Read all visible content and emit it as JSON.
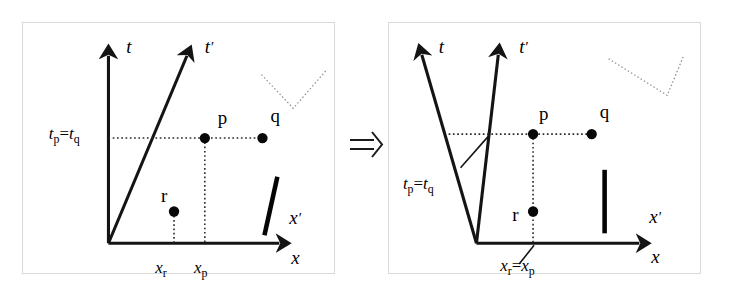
{
  "figure": {
    "transform_symbol": "⇒",
    "transform_name": "implies-arrow"
  },
  "panels": [
    {
      "id": "left",
      "name": "unprimed-frame-diagram",
      "caption": "Events p, q simultaneous in unprimed frame; t' axis tilted",
      "axes": [
        {
          "name": "t-axis",
          "label": "t",
          "prime": false,
          "orientation": "vertical",
          "label_x": 104,
          "label_y": 30
        },
        {
          "name": "t-prime-axis",
          "label": "t",
          "prime": true,
          "orientation": "tilted-right",
          "label_x": 183,
          "label_y": 30
        },
        {
          "name": "x-prime-axis",
          "label": "x",
          "prime": true,
          "orientation": "horizontal",
          "label_x": 268,
          "label_y": 203
        },
        {
          "name": "x-axis",
          "label": "x",
          "prime": false,
          "orientation": "horizontal",
          "label_x": 270,
          "label_y": 243
        }
      ],
      "tick_labels": [
        {
          "name": "t-p-equals-t-q-label",
          "base1": "t",
          "sub1": "p",
          "eq": "=",
          "base2": "t",
          "sub2": "q",
          "x": 26,
          "y": 117
        },
        {
          "name": "x-r-label",
          "base1": "x",
          "sub1": "r",
          "x": 133,
          "y": 252
        },
        {
          "name": "x-p-label",
          "base1": "x",
          "sub1": "p",
          "x": 172,
          "y": 252
        }
      ],
      "events": [
        {
          "name": "event-p",
          "label": "p",
          "cx": 183,
          "cy": 116,
          "label_x": 196,
          "label_y": 102
        },
        {
          "name": "event-q",
          "label": "q",
          "cx": 241,
          "cy": 116,
          "label_x": 249,
          "label_y": 100
        },
        {
          "name": "event-r",
          "label": "r",
          "cx": 152,
          "cy": 190,
          "label_x": 139,
          "label_y": 180
        }
      ],
      "rod": {
        "name": "rod-tilted",
        "x1": 256,
        "y1": 155,
        "x2": 243,
        "y2": 214,
        "width": 4.6
      },
      "marker": {
        "name": "dotted-v-marker",
        "points": "240,52 272,86 305,48"
      }
    },
    {
      "id": "right",
      "name": "primed-frame-diagram",
      "caption": "Events p, r at same position in primed frame; t axis tilted left",
      "axes": [
        {
          "name": "t-axis",
          "label": "t",
          "prime": false,
          "orientation": "tilted-left",
          "label_x": 50,
          "label_y": 30
        },
        {
          "name": "t-prime-axis",
          "label": "t",
          "prime": true,
          "orientation": "vertical",
          "label_x": 131,
          "label_y": 30
        },
        {
          "name": "x-prime-axis",
          "label": "x",
          "prime": true,
          "orientation": "horizontal",
          "label_x": 262,
          "label_y": 202
        },
        {
          "name": "x-axis",
          "label": "x",
          "prime": false,
          "orientation": "horizontal",
          "label_x": 264,
          "label_y": 242
        }
      ],
      "tick_labels": [
        {
          "name": "t-p-equals-t-q-label",
          "base1": "t",
          "sub1": "p",
          "eq": "=",
          "base2": "t",
          "sub2": "q",
          "x": 14,
          "y": 167
        },
        {
          "name": "x-r-equals-x-p-label",
          "base1": "x",
          "sub1": "r",
          "eq": "=",
          "base2": "x",
          "sub2": "p",
          "x": 112,
          "y": 250
        }
      ],
      "events": [
        {
          "name": "event-p",
          "label": "p",
          "cx": 145,
          "cy": 112,
          "label_x": 151,
          "label_y": 98
        },
        {
          "name": "event-r",
          "label": "r",
          "cx": 145,
          "cy": 190,
          "label_x": 124,
          "label_y": 200
        },
        {
          "name": "event-q",
          "label": "q",
          "cx": 204,
          "cy": 112,
          "label_x": 212,
          "label_y": 96
        }
      ],
      "rod": {
        "name": "rod-vertical",
        "x1": 217,
        "y1": 148,
        "x2": 217,
        "y2": 212,
        "width": 4.6
      },
      "marker": {
        "name": "dotted-v-marker",
        "points": "221,36 280,73 297,32"
      }
    }
  ]
}
